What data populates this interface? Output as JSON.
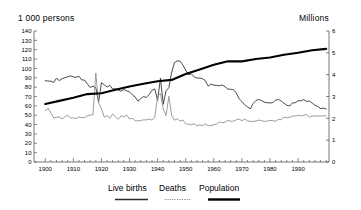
{
  "left_axis_unit": "1 000 persons",
  "right_axis_unit": "Millions",
  "legend": {
    "births": "Live births",
    "deaths": "Deaths",
    "population": "Population"
  },
  "colors": {
    "births": "#2b2b2b",
    "deaths": "#8a8a8a",
    "population": "#000000",
    "axis": "#555555",
    "text": "#000000"
  },
  "geometry": {
    "x0": 34,
    "x1": 329,
    "ybottom": 162,
    "ytop": 31,
    "xmin": 1896,
    "xmax": 2001
  },
  "chart_data": {
    "type": "line",
    "title": "",
    "xlabel": "",
    "ylabel": "1 000 persons",
    "y2label": "Millions",
    "grid": false,
    "legend_position": "bottom",
    "xlim": [
      1896,
      2001
    ],
    "ylim": [
      0,
      140
    ],
    "y2lim": [
      0,
      6
    ],
    "xticks": [
      1900,
      1910,
      1920,
      1930,
      1940,
      1950,
      1960,
      1970,
      1980,
      1990
    ],
    "xticklabels": [
      "1900",
      "1910",
      "1920",
      "1930",
      "1940",
      "1950",
      "1960",
      "1970",
      "1980",
      "1990"
    ],
    "xminor_step": 2,
    "yticks": [
      0,
      10,
      20,
      30,
      40,
      50,
      60,
      70,
      80,
      90,
      100,
      110,
      120,
      130,
      140
    ],
    "yticklabels": [
      "0",
      "10",
      "20",
      "30",
      "40",
      "50",
      "60",
      "70",
      "80",
      "90",
      "100",
      "110",
      "120",
      "130",
      "140"
    ],
    "y2ticks": [
      0,
      1,
      2,
      3,
      4,
      5,
      6
    ],
    "y2ticklabels": [
      "0",
      "1",
      "2",
      "3",
      "4",
      "5",
      "6"
    ],
    "x": [
      1900,
      1901,
      1902,
      1903,
      1904,
      1905,
      1906,
      1907,
      1908,
      1909,
      1910,
      1911,
      1912,
      1913,
      1914,
      1915,
      1916,
      1917,
      1918,
      1919,
      1920,
      1921,
      1922,
      1923,
      1924,
      1925,
      1926,
      1927,
      1928,
      1929,
      1930,
      1931,
      1932,
      1933,
      1934,
      1935,
      1936,
      1937,
      1938,
      1939,
      1940,
      1941,
      1942,
      1943,
      1944,
      1945,
      1946,
      1947,
      1948,
      1949,
      1950,
      1951,
      1952,
      1953,
      1954,
      1955,
      1956,
      1957,
      1958,
      1959,
      1960,
      1961,
      1962,
      1963,
      1964,
      1965,
      1966,
      1967,
      1968,
      1969,
      1970,
      1971,
      1972,
      1973,
      1974,
      1975,
      1976,
      1977,
      1978,
      1979,
      1980,
      1981,
      1982,
      1983,
      1984,
      1985,
      1986,
      1987,
      1988,
      1989,
      1990,
      1991,
      1992,
      1993,
      1994,
      1995,
      1996,
      1997,
      1998,
      1999,
      2000
    ],
    "series": [
      {
        "name": "Live births",
        "axis": "left",
        "unit": "1 000 persons",
        "values": [
          86.9,
          86.6,
          86.3,
          85.0,
          89.5,
          87.0,
          89.0,
          90.1,
          91.1,
          92.0,
          91.0,
          90.5,
          91.7,
          87.6,
          87.6,
          83.3,
          79.7,
          81.0,
          79.5,
          63.9,
          84.7,
          82.5,
          80.1,
          81.9,
          78.0,
          78.3,
          76.9,
          75.6,
          77.5,
          76.0,
          75.0,
          71.9,
          69.4,
          65.0,
          67.7,
          69.9,
          68.9,
          72.3,
          76.7,
          78.2,
          65.8,
          89.6,
          61.7,
          76.1,
          79.4,
          95.8,
          106.1,
          108.2,
          107.8,
          103.5,
          98.1,
          93.1,
          94.3,
          90.9,
          89.8,
          89.7,
          88.9,
          86.9,
          81.1,
          83.3,
          82.1,
          81.9,
          81.5,
          82.3,
          80.4,
          77.9,
          77.7,
          77.3,
          73.7,
          67.5,
          64.6,
          61.1,
          58.9,
          56.8,
          62.5,
          65.7,
          66.9,
          65.7,
          63.9,
          63.4,
          63.1,
          63.5,
          66.1,
          66.9,
          65.1,
          62.8,
          60.6,
          59.8,
          63.3,
          63.3,
          65.5,
          65.4,
          66.7,
          64.8,
          65.2,
          63.1,
          60.7,
          59.3,
          57.1,
          57.6,
          56.7
        ]
      },
      {
        "name": "Deaths",
        "axis": "left",
        "unit": "1 000 persons",
        "values": [
          54.6,
          57.6,
          52.4,
          47.2,
          47.6,
          48.2,
          46.0,
          48.3,
          50.0,
          47.1,
          47.2,
          46.3,
          48.3,
          47.3,
          47.6,
          49.2,
          50.5,
          50.3,
          95.1,
          62.9,
          57.0,
          48.0,
          49.6,
          46.8,
          51.4,
          48.1,
          45.7,
          49.4,
          48.1,
          50.2,
          46.0,
          46.7,
          44.2,
          43.9,
          44.3,
          45.0,
          45.0,
          46.0,
          44.7,
          47.8,
          70.0,
          73.3,
          56.6,
          49.6,
          70.2,
          49.8,
          44.7,
          46.1,
          43.8,
          44.9,
          40.7,
          40.4,
          39.7,
          40.8,
          38.7,
          39.6,
          38.9,
          40.7,
          38.8,
          38.8,
          39.8,
          40.6,
          42.9,
          42.0,
          42.5,
          44.5,
          43.5,
          43.8,
          45.0,
          45.9,
          44.1,
          45.9,
          43.9,
          43.4,
          43.4,
          43.8,
          44.8,
          44.1,
          43.5,
          43.7,
          44.4,
          44.4,
          43.4,
          45.6,
          45.1,
          48.1,
          47.1,
          47.9,
          49.1,
          49.1,
          50.1,
          49.3,
          49.8,
          50.9,
          48.0,
          49.3,
          49.2,
          49.1,
          49.3,
          49.3,
          49.3
        ]
      },
      {
        "name": "Population",
        "axis": "right",
        "unit": "Millions",
        "x": [
          1900,
          1905,
          1910,
          1915,
          1920,
          1925,
          1930,
          1935,
          1940,
          1945,
          1950,
          1955,
          1960,
          1965,
          1970,
          1975,
          1980,
          1985,
          1990,
          1995,
          2000
        ],
        "values": [
          2.66,
          2.8,
          2.94,
          3.11,
          3.15,
          3.31,
          3.46,
          3.58,
          3.7,
          3.76,
          4.03,
          4.24,
          4.45,
          4.61,
          4.61,
          4.72,
          4.79,
          4.91,
          5.0,
          5.12,
          5.18
        ]
      }
    ]
  }
}
